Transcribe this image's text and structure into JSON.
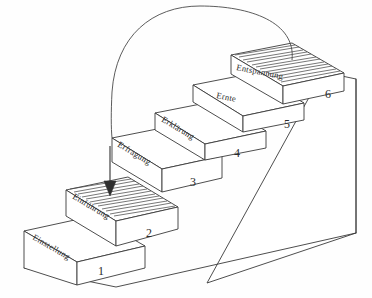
{
  "diagram": {
    "background_color": "#fefefe",
    "ink_color": "#3a3a3a",
    "steps": [
      {
        "number": "1",
        "label": "Einstellung"
      },
      {
        "number": "2",
        "label": "Einführung"
      },
      {
        "number": "3",
        "label": "Erfragung"
      },
      {
        "number": "4",
        "label": "Erklärung"
      },
      {
        "number": "5",
        "label": "Ernte"
      },
      {
        "number": "6",
        "label": "Entspannung"
      }
    ],
    "annotations": {
      "arc_name": "return-arc",
      "arrow_name": "down-arrow"
    }
  }
}
